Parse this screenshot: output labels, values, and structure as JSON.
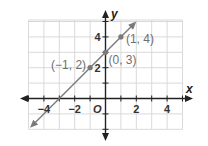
{
  "chart_data": {
    "type": "line",
    "title": "",
    "xlabel": "x",
    "ylabel": "y",
    "origin_label": "O",
    "xlim": [
      -5,
      5
    ],
    "ylim": [
      -2,
      5
    ],
    "grid": true,
    "x_ticks": [
      -4,
      -2,
      2,
      4
    ],
    "x_tick_labels": [
      "−4",
      "−2",
      "2",
      "4"
    ],
    "y_ticks": [
      2,
      4
    ],
    "y_tick_labels": [
      "2",
      "4"
    ],
    "series": [
      {
        "name": "y = x + 3",
        "slope": 1,
        "intercept": 3,
        "x_range": [
          -4.9,
          2
        ],
        "color": "#7a7a7a",
        "points": [
          {
            "x": -1,
            "y": 2,
            "label": "(−1, 2)"
          },
          {
            "x": 0,
            "y": 3,
            "label": "(0, 3)"
          },
          {
            "x": 1,
            "y": 4,
            "label": "(1, 4)"
          }
        ]
      }
    ],
    "colors": {
      "axis": "#222222",
      "grid": "#d9d9d9",
      "line": "#7a7a7a",
      "point_label": "#6f6f6f"
    }
  }
}
